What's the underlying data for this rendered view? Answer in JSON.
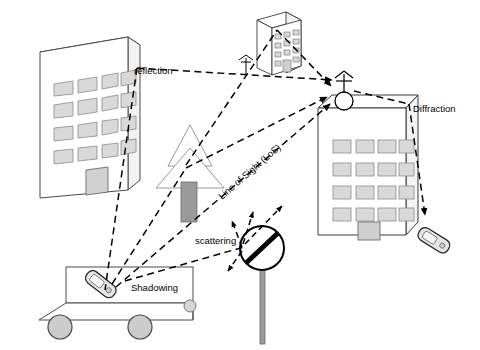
{
  "diagram": {
    "background_color": "#ffffff",
    "line_color": "#000000",
    "fill_window": "#d9d9d9",
    "fill_pole": "#9a9a9a",
    "fill_wheel": "#cccccc",
    "labels": {
      "reflection": "reflection",
      "diffraction": "Diffraction",
      "scattering": "scattering",
      "shadowing": "Shadowing",
      "line_of_sight": "Line of Sight (LoS)"
    },
    "objects": {
      "left_building": "left-building",
      "right_building": "right-building",
      "top_building": "top-building",
      "tree": "tree",
      "truck": "truck",
      "mobile_on_truck": "mobile-phone",
      "mobile_right": "mobile-phone",
      "street_sign": "street-sign-scatterer",
      "base_station_antenna": "base-station-antenna",
      "small_antenna": "small-antenna"
    },
    "paths": [
      "reflection",
      "diffraction",
      "scattering",
      "shadowing",
      "line-of-sight"
    ]
  }
}
